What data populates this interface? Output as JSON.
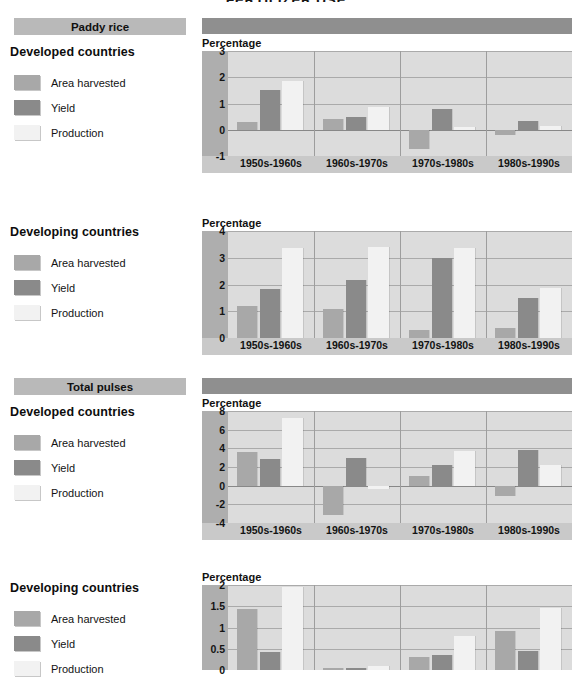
{
  "page": {
    "title": "FERTILIZER USE"
  },
  "legend_colors": {
    "area_harvested": "#a8a8a8",
    "yield": "#8a8a8a",
    "production": "#f2f2f2"
  },
  "legend": {
    "area_harvested": "Area harvested",
    "yield": "Yield",
    "production": "Production"
  },
  "axis_label": "Percentage",
  "periods": [
    "1950s-1960s",
    "1960s-1970s",
    "1970s-1980s",
    "1980s-1990s"
  ],
  "sections": [
    {
      "banner": "Paddy rice",
      "blocks": [
        {
          "country": "Developed countries",
          "chart": 0
        },
        {
          "country": "Developing countries",
          "chart": 1
        }
      ]
    },
    {
      "banner": "Total pulses",
      "blocks": [
        {
          "country": "Developed countries",
          "chart": 2
        },
        {
          "country": "Developing countries",
          "chart": 3
        }
      ]
    }
  ],
  "chart_data": [
    {
      "type": "bar",
      "title": "Paddy rice - Developed countries",
      "xlabel": "",
      "ylabel": "Percentage",
      "categories": [
        "1950s-1960s",
        "1960s-1970s",
        "1970s-1980s",
        "1980s-1990s"
      ],
      "series": [
        {
          "name": "Area harvested",
          "values": [
            0.3,
            0.4,
            -0.75,
            -0.2
          ]
        },
        {
          "name": "Yield",
          "values": [
            1.5,
            0.47,
            0.78,
            0.35
          ]
        },
        {
          "name": "Production",
          "values": [
            1.85,
            0.88,
            0.1,
            0.15
          ]
        }
      ],
      "ylim": [
        -1,
        3
      ],
      "yticks": [
        -1,
        0,
        1,
        2,
        3
      ],
      "grid": true,
      "legend": "left"
    },
    {
      "type": "bar",
      "title": "Paddy rice - Developing countries",
      "xlabel": "",
      "ylabel": "Percentage",
      "categories": [
        "1950s-1960s",
        "1960s-1970s",
        "1970s-1980s",
        "1980s-1990s"
      ],
      "series": [
        {
          "name": "Area harvested",
          "values": [
            1.2,
            1.07,
            0.3,
            0.38
          ]
        },
        {
          "name": "Yield",
          "values": [
            1.82,
            2.15,
            3.0,
            1.5
          ]
        },
        {
          "name": "Production",
          "values": [
            3.35,
            3.42,
            3.38,
            1.88
          ]
        }
      ],
      "ylim": [
        0,
        4
      ],
      "yticks": [
        0,
        1,
        2,
        3,
        4
      ],
      "grid": true,
      "legend": "left"
    },
    {
      "type": "bar",
      "title": "Total pulses - Developed countries",
      "xlabel": "",
      "ylabel": "Percentage",
      "categories": [
        "1950s-1960s",
        "1960s-1970s",
        "1970s-1980s",
        "1980s-1990s"
      ],
      "series": [
        {
          "name": "Area harvested",
          "values": [
            3.6,
            -3.1,
            1.05,
            -1.1
          ]
        },
        {
          "name": "Yield",
          "values": [
            2.9,
            2.95,
            2.2,
            3.8
          ]
        },
        {
          "name": "Production",
          "values": [
            7.3,
            -0.35,
            3.7,
            2.2
          ]
        }
      ],
      "ylim": [
        -4,
        8
      ],
      "yticks": [
        -4,
        -2,
        0,
        2,
        4,
        6,
        8
      ],
      "grid": true,
      "legend": "left"
    },
    {
      "type": "bar",
      "title": "Total pulses - Developing countries",
      "xlabel": "",
      "ylabel": "Percentage",
      "categories": [
        "1950s-1960s",
        "1960s-1970s",
        "1970s-1980s",
        "1980s-1990s"
      ],
      "series": [
        {
          "name": "Area harvested",
          "values": [
            1.44,
            0.05,
            0.3,
            0.92
          ]
        },
        {
          "name": "Yield",
          "values": [
            0.42,
            0.05,
            0.35,
            0.45
          ]
        },
        {
          "name": "Production",
          "values": [
            1.95,
            0.1,
            0.8,
            1.45
          ]
        }
      ],
      "ylim": [
        0,
        2
      ],
      "yticks": [
        0,
        0.5,
        1,
        1.5,
        2
      ],
      "grid": true,
      "legend": "left",
      "clipped": true
    }
  ]
}
